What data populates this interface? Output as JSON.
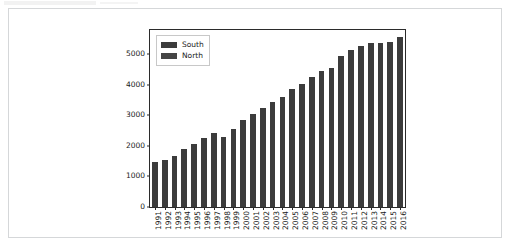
{
  "figure": {
    "panel_background": "#ffffff",
    "panel_border_color": "#d5d7d9",
    "axes_border_color": "#2b2b2b"
  },
  "legend": {
    "position": "upper-left-inside",
    "entries": [
      {
        "label": "South",
        "color": "#3c3c3c"
      },
      {
        "label": "North",
        "color": "#454545"
      }
    ]
  },
  "chart_data": {
    "type": "bar",
    "title": "",
    "subtitle": "",
    "xlabel": "",
    "ylabel": "",
    "grid": false,
    "legend_position": "upper left",
    "bar_color": "#3c3c3c",
    "xlim_categories": 26,
    "ylim": [
      0,
      5800
    ],
    "yticks": [
      0,
      1000,
      2000,
      3000,
      4000,
      5000
    ],
    "ytick_labels": [
      "0",
      "1000",
      "2000",
      "3000",
      "4000",
      "5000"
    ],
    "categories": [
      "1991",
      "1992",
      "1993",
      "1994",
      "1995",
      "1996",
      "1997",
      "1998",
      "1999",
      "2000",
      "2001",
      "2002",
      "2003",
      "2004",
      "2005",
      "2006",
      "2007",
      "2008",
      "2009",
      "2010",
      "2011",
      "2012",
      "2013",
      "2014",
      "2015",
      "2016"
    ],
    "series": [
      {
        "name": "South",
        "color": "#3c3c3c",
        "values": [
          1470,
          1550,
          1660,
          1890,
          2070,
          2250,
          2410,
          2300,
          2570,
          2840,
          3050,
          3250,
          3430,
          3620,
          3870,
          4030,
          4250,
          4470,
          4550,
          4960,
          5150,
          5290,
          5370,
          5390,
          5410,
          5560
        ]
      },
      {
        "name": "North",
        "color": "#454545",
        "values": [
          0,
          0,
          0,
          0,
          0,
          0,
          0,
          0,
          0,
          0,
          0,
          0,
          0,
          0,
          0,
          0,
          0,
          0,
          0,
          0,
          0,
          0,
          0,
          0,
          0,
          0
        ]
      }
    ]
  }
}
